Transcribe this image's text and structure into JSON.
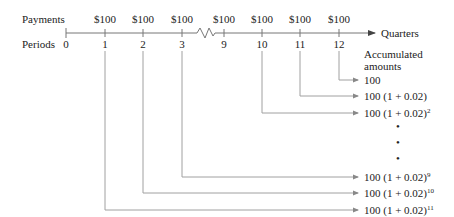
{
  "diagram": {
    "row_labels": {
      "payments": "Payments",
      "periods": "Periods"
    },
    "axis_label": "Quarters",
    "payments": [
      {
        "period": "1",
        "amount": "$100"
      },
      {
        "period": "2",
        "amount": "$100"
      },
      {
        "period": "3",
        "amount": "$100"
      },
      {
        "period": "9",
        "amount": "$100"
      },
      {
        "period": "10",
        "amount": "$100"
      },
      {
        "period": "11",
        "amount": "$100"
      },
      {
        "period": "12",
        "amount": "$100"
      }
    ],
    "periods": [
      "0",
      "1",
      "2",
      "3",
      "9",
      "10",
      "11",
      "12"
    ],
    "accumulated_header": [
      "Accumulated",
      "amounts"
    ],
    "accumulated": [
      {
        "from_period": "12",
        "base": "100",
        "exponent": ""
      },
      {
        "from_period": "11",
        "base": "100 (1 + 0.02)",
        "exponent": ""
      },
      {
        "from_period": "10",
        "base": "100 (1 + 0.02)",
        "exponent": "2"
      },
      {
        "from_period": "3",
        "base": "100 (1 + 0.02)",
        "exponent": "9"
      },
      {
        "from_period": "2",
        "base": "100 (1 + 0.02)",
        "exponent": "10"
      },
      {
        "from_period": "1",
        "base": "100 (1 + 0.02)",
        "exponent": "11"
      }
    ],
    "ellipsis": [
      "•",
      "•",
      "•"
    ],
    "colors": {
      "line": "#9a9a9a",
      "text": "#222222",
      "background": "#ffffff"
    }
  }
}
